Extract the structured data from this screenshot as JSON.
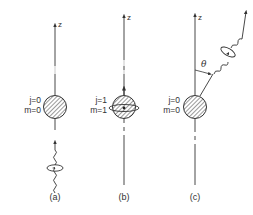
{
  "panels": [
    {
      "caption": "(a)",
      "axis_label": "z",
      "j_label": "j=0",
      "m_label": "m=0",
      "description": "Atom with j=0, m=0 absorbing a circularly polarized photon incoming along z"
    },
    {
      "caption": "(b)",
      "axis_label": "",
      "j_label": "j=1",
      "m_label": "m=1",
      "description": "Atom excited to j=1, m=1 with angular momentum along z"
    },
    {
      "caption": "(c)",
      "axis_label": "z",
      "j_label": "j=0",
      "m_label": "m=0",
      "angle_label": "θ",
      "description": "Atom decays back to j=0, m=0 emitting photon at angle θ from z"
    }
  ],
  "colors": {
    "line": "#333333",
    "hatch": "#555555",
    "background": "#ffffff"
  }
}
